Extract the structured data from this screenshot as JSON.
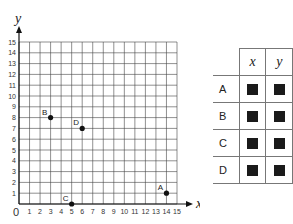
{
  "chart_data": {
    "type": "scatter",
    "title": "",
    "xlabel": "x",
    "ylabel": "y",
    "xlim": [
      0,
      15
    ],
    "ylim": [
      0,
      15
    ],
    "grid": true,
    "x_ticks": [
      "0",
      "1",
      "2",
      "3",
      "4",
      "5",
      "6",
      "7",
      "8",
      "9",
      "10",
      "11",
      "12",
      "13",
      "14",
      "15"
    ],
    "y_ticks": [
      "1",
      "2",
      "3",
      "4",
      "5",
      "6",
      "7",
      "8",
      "9",
      "10",
      "11",
      "12",
      "13",
      "14",
      "15"
    ],
    "points": [
      {
        "label": "A",
        "x": 14,
        "y": 1
      },
      {
        "label": "B",
        "x": 3,
        "y": 8
      },
      {
        "label": "C",
        "x": 5,
        "y": 0
      },
      {
        "label": "D",
        "x": 6,
        "y": 7
      }
    ]
  },
  "table": {
    "headers": [
      "x",
      "y"
    ],
    "rows": [
      {
        "label": "A",
        "x": "■",
        "y": "■"
      },
      {
        "label": "B",
        "x": "■",
        "y": "■"
      },
      {
        "label": "C",
        "x": "■",
        "y": "■"
      },
      {
        "label": "D",
        "x": "■",
        "y": "■"
      }
    ]
  }
}
